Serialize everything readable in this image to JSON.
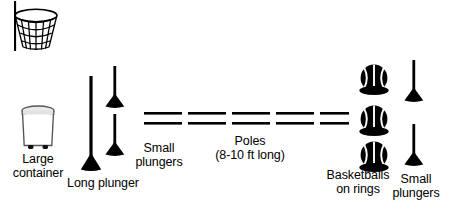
{
  "diagram": {
    "background_color": "#ffffff",
    "ink_color": "#000000",
    "labels": {
      "large_container": "Large\ncontainer",
      "long_plunger": "Long plunger",
      "small_plungers_left": "Small\nplungers",
      "poles": "Poles\n(8-10 ft long)",
      "basketballs_on_rings": "Basketballs\non rings",
      "small_plungers_right": "Small\nplungers"
    },
    "items": [
      {
        "name": "basketball-hoop",
        "icon": "basketball-hoop-with-net-icon",
        "count": 1,
        "label": ""
      },
      {
        "name": "large-container",
        "icon": "large-container-icon",
        "count": 1,
        "label": "Large\ncontainer"
      },
      {
        "name": "long-plunger",
        "icon": "long-plunger-icon",
        "count": 1,
        "label": "Long plunger"
      },
      {
        "name": "small-plungers-left",
        "icon": "small-plunger-icon",
        "count": 2,
        "label": "Small\nplungers"
      },
      {
        "name": "poles",
        "icon": "pole-icon",
        "count": 5,
        "label": "Poles\n(8-10 ft long)"
      },
      {
        "name": "basketballs-on-rings",
        "icon": "basketball-on-ring-icon",
        "count": 3,
        "label": "Basketballs\non rings"
      },
      {
        "name": "small-plungers-right",
        "icon": "small-plunger-icon",
        "count": 2,
        "label": "Small\nplungers"
      }
    ]
  }
}
